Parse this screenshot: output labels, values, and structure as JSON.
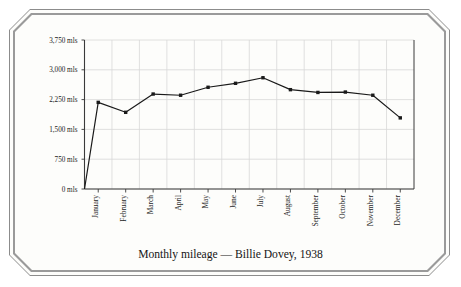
{
  "chart_data": {
    "type": "line",
    "title": "Monthly mileage — Billie Dovey, 1938",
    "xlabel": "",
    "ylabel": "",
    "categories": [
      "January",
      "February",
      "March",
      "April",
      "May",
      "June",
      "July",
      "August",
      "September",
      "October",
      "November",
      "December"
    ],
    "values": [
      2180,
      1930,
      2390,
      2360,
      2560,
      2660,
      2800,
      2500,
      2430,
      2440,
      2360,
      1790
    ],
    "series": [
      {
        "name": "Monthly mileage",
        "values": [
          2180,
          1930,
          2390,
          2360,
          2560,
          2660,
          2800,
          2500,
          2430,
          2440,
          2360,
          1790
        ]
      }
    ],
    "ylim": [
      0,
      3750
    ],
    "y_ticks": [
      0,
      750,
      1500,
      2250,
      3000,
      3750
    ],
    "y_tick_labels": [
      "0 mls",
      "750 mls",
      "1,500 mls",
      "2,250 mls",
      "3,000 mls",
      "3,750 mls"
    ],
    "unit": "mls",
    "grid": true,
    "legend": false,
    "marker": "square",
    "line_color": "#1a1a1a",
    "grid_color": "#d8d8d8",
    "axis_color": "#3a3a3a",
    "background_color": "#fdfdfb",
    "origin_connected": true,
    "annotations": []
  },
  "frame": {
    "style": "chamfered-double-border",
    "border_color": "#8c8c8c"
  }
}
